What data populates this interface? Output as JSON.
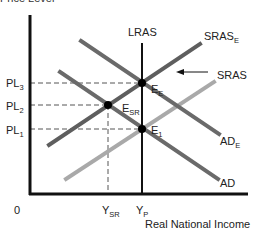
{
  "diagram": {
    "ylabel_partial": "Price Level",
    "xlabel": "Real National Income",
    "origin": "0",
    "colors": {
      "axis": "#111111",
      "lras": "#111111",
      "sras": "#a9a9a9",
      "sras_e": "#5e5e5e",
      "ad": "#6a6a6a",
      "ad_e": "#6a6a6a",
      "guides": "#555555",
      "points": "#000000"
    },
    "curves": {
      "lras": {
        "label": "LRAS",
        "x": 142,
        "y1": 43,
        "y2": 194
      },
      "sras_e": {
        "label": "SRAS",
        "sub": "E",
        "x1": 49,
        "y1": 145,
        "x2": 200,
        "y2": 44
      },
      "sras": {
        "label": "SRAS",
        "sub": "",
        "x1": 66,
        "y1": 179,
        "x2": 214,
        "y2": 82
      },
      "ad_e": {
        "label": "AD",
        "sub": "E",
        "x1": 81,
        "y1": 41,
        "x2": 219,
        "y2": 134
      },
      "ad": {
        "label": "AD",
        "sub": "",
        "x1": 60,
        "y1": 72,
        "x2": 218,
        "y2": 179
      }
    },
    "price_levels": [
      {
        "label": "PL",
        "sub": "3",
        "y": 83
      },
      {
        "label": "PL",
        "sub": "2",
        "y": 105
      },
      {
        "label": "PL",
        "sub": "1",
        "y": 129
      }
    ],
    "income_levels": [
      {
        "label": "Y",
        "sub": "SR",
        "x": 108
      },
      {
        "label": "Y",
        "sub": "P",
        "x": 142
      }
    ],
    "equilibria": [
      {
        "label": "E",
        "sub": "E",
        "x": 142,
        "y": 83
      },
      {
        "label": "E",
        "sub": "SR",
        "x": 108,
        "y": 105
      },
      {
        "label": "E",
        "sub": "1",
        "x": 142,
        "y": 129
      }
    ],
    "shift_arrow": {
      "from_x": 208,
      "to_x": 177,
      "y": 72,
      "meaning": "SRAS shifts left to SRAS_E"
    }
  }
}
